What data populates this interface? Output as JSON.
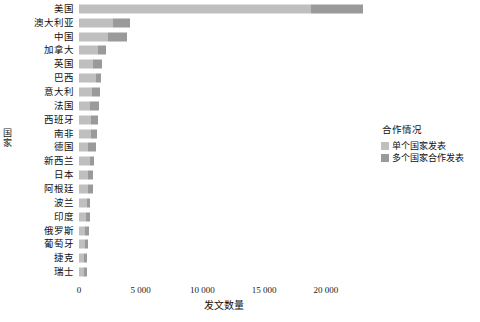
{
  "chart_data": {
    "type": "bar",
    "orientation": "horizontal",
    "stacked": true,
    "title": "",
    "xlabel": "发文数量",
    "ylabel": "国家",
    "xlim": [
      0,
      23500
    ],
    "xticks": [
      0,
      5000,
      10000,
      15000,
      20000
    ],
    "xtick_labels": [
      "0",
      "5 000",
      "10 000",
      "15 000",
      "20 000"
    ],
    "grid": false,
    "legend": {
      "title": "合作情况",
      "position": "right",
      "entries": [
        {
          "name": "单个国家发表",
          "color": "#bfbfbf"
        },
        {
          "name": "多个国家合作发表",
          "color": "#9a9a9a"
        }
      ]
    },
    "categories": [
      "美国",
      "澳大利亚",
      "中国",
      "加拿大",
      "英国",
      "巴西",
      "意大利",
      "法国",
      "西班牙",
      "南非",
      "德国",
      "新西兰",
      "日本",
      "阿根廷",
      "波兰",
      "印度",
      "俄罗斯",
      "葡萄牙",
      "捷克",
      "瑞士"
    ],
    "series": [
      {
        "name": "单个国家发表",
        "color": "#bfbfbf",
        "values": [
          18800,
          2750,
          2340,
          1500,
          1130,
          1400,
          1050,
          870,
          950,
          1000,
          760,
          880,
          760,
          700,
          620,
          600,
          520,
          450,
          430,
          380
        ]
      },
      {
        "name": "多个国家合作发表",
        "color": "#9a9a9a",
        "values": [
          4200,
          1350,
          1580,
          700,
          740,
          350,
          620,
          720,
          620,
          470,
          600,
          370,
          390,
          420,
          310,
          260,
          300,
          300,
          250,
          240
        ]
      }
    ],
    "totals": [
      23000,
      4100,
      3920,
      2200,
      1870,
      1750,
      1670,
      1590,
      1570,
      1470,
      1360,
      1250,
      1150,
      1120,
      930,
      860,
      820,
      750,
      680,
      620
    ]
  }
}
